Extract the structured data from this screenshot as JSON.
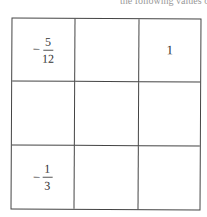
{
  "header_fragment": "the following values of the squ",
  "grid": {
    "rows": 3,
    "cols": 3,
    "cells": [
      {
        "sign": "−",
        "num": "5",
        "den": "12"
      },
      {
        "value": ""
      },
      {
        "value": "1"
      },
      {
        "value": ""
      },
      {
        "value": ""
      },
      {
        "value": ""
      },
      {
        "sign": "−",
        "num": "1",
        "den": "3"
      },
      {
        "value": ""
      },
      {
        "value": ""
      }
    ]
  }
}
